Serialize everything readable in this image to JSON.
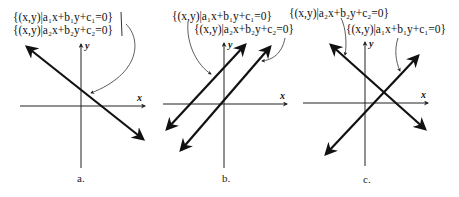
{
  "panels": [
    {
      "caption": "a.",
      "set1": "{(x,y)|a₁x+b₁y+c₁=0}",
      "set2": "{(x,y)|a₂x+b₂y+c₂=0}",
      "x_label": "x",
      "y_label": "y",
      "relation": "coincident"
    },
    {
      "caption": "b.",
      "set1": "{(x,y)|a₁x+b₁y+c₁=0}",
      "set2": "{(x,y)|a₂x+b₂y+c₂=0}",
      "x_label": "x",
      "y_label": "y",
      "relation": "parallel"
    },
    {
      "caption": "c.",
      "set1": "{(x,y)|a₂x+b₂y+c₂=0}",
      "set2": "{(x,y)|a₁x+b₁y+c₁=0}",
      "x_label": "x",
      "y_label": "y",
      "relation": "intersecting"
    }
  ]
}
